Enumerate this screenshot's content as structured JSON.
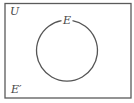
{
  "diagram": {
    "type": "venn",
    "universal_set": {
      "label": "U"
    },
    "sets": [
      {
        "label": "E"
      }
    ],
    "complement": {
      "label": "E′"
    },
    "colors": {
      "stroke": "#555555",
      "background": "#ffffff",
      "text": "#444444"
    }
  }
}
